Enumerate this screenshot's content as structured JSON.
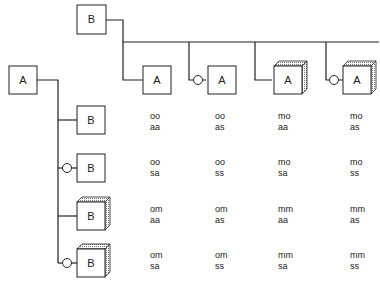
{
  "top_root": {
    "label": "B"
  },
  "left_root": {
    "label": "A"
  },
  "top_children": [
    {
      "label": "A",
      "style": "plain",
      "connector": "line"
    },
    {
      "label": "A",
      "style": "plain",
      "connector": "circle"
    },
    {
      "label": "A",
      "style": "cube",
      "connector": "line"
    },
    {
      "label": "A",
      "style": "cube",
      "connector": "circle"
    }
  ],
  "left_children": [
    {
      "label": "B",
      "style": "plain",
      "connector": "line"
    },
    {
      "label": "B",
      "style": "plain",
      "connector": "circle"
    },
    {
      "label": "B",
      "style": "cube",
      "connector": "line"
    },
    {
      "label": "B",
      "style": "cube",
      "connector": "circle"
    }
  ],
  "matrix": [
    [
      {
        "top": "oo",
        "bottom": "aa"
      },
      {
        "top": "oo",
        "bottom": "as"
      },
      {
        "top": "mo",
        "bottom": "aa"
      },
      {
        "top": "mo",
        "bottom": "as"
      }
    ],
    [
      {
        "top": "oo",
        "bottom": "sa"
      },
      {
        "top": "oo",
        "bottom": "ss"
      },
      {
        "top": "mo",
        "bottom": "sa"
      },
      {
        "top": "mo",
        "bottom": "ss"
      }
    ],
    [
      {
        "top": "om",
        "bottom": "aa"
      },
      {
        "top": "om",
        "bottom": "as"
      },
      {
        "top": "mm",
        "bottom": "aa"
      },
      {
        "top": "mm",
        "bottom": "as"
      }
    ],
    [
      {
        "top": "om",
        "bottom": "sa"
      },
      {
        "top": "om",
        "bottom": "ss"
      },
      {
        "top": "mm",
        "bottom": "sa"
      },
      {
        "top": "mm",
        "bottom": "ss"
      }
    ]
  ]
}
